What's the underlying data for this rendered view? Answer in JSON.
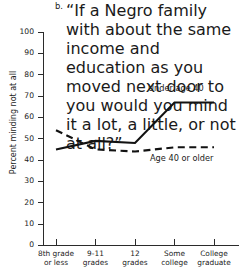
{
  "figure": {
    "letter": "b.",
    "title_lines": [
      "“If a Negro family with about the",
      "same income and education as you",
      "moved next door to you would you",
      "mind it a lot, a little, or not at all?”"
    ],
    "title_full": "b. “If a Negro family with about the same income and education as you moved next door to you would you mind it a lot, a little, or not at all?”"
  },
  "colors": {
    "line": "#121212",
    "axis": "#2b2b2b",
    "background": "#ffffff",
    "text": "#1a1a1a"
  },
  "chart_data": {
    "type": "line",
    "title": "b. “If a Negro family with about the same income and education as you moved next door to you would you mind it a lot, a little, or not at all?”",
    "xlabel": "",
    "ylabel": "Percent minding not at all",
    "categories": [
      "8th grade or less",
      "9-11 grades",
      "12 grades",
      "Some college",
      "College graduate"
    ],
    "category_lines": [
      [
        "8th grade",
        "or less"
      ],
      [
        "9-11",
        "grades"
      ],
      [
        "12",
        "grades"
      ],
      [
        "Some",
        "college"
      ],
      [
        "College",
        "graduate"
      ]
    ],
    "yticks": [
      0,
      10,
      20,
      30,
      40,
      50,
      60,
      70,
      80,
      90,
      100
    ],
    "ylim": [
      0,
      100
    ],
    "grid": false,
    "legend": "inline-annotations",
    "series": [
      {
        "name": "Under age 40",
        "style": "solid",
        "values": [
          45,
          49,
          48,
          67,
          67
        ]
      },
      {
        "name": "Age 40 or older",
        "style": "dashed",
        "values": [
          54,
          45,
          44,
          46,
          46
        ]
      }
    ]
  }
}
